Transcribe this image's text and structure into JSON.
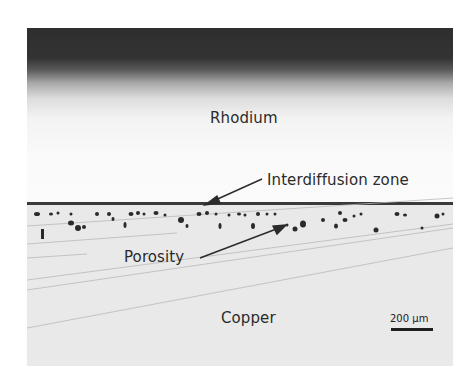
{
  "figure": {
    "type": "optical micrograph cross-section",
    "labels": {
      "top_layer": "Rhodium",
      "interface": "Interdiffusion zone",
      "defects": "Porosity",
      "substrate": "Copper"
    },
    "scale_bar": {
      "label": "200 µm",
      "value": 200,
      "unit": "µm"
    },
    "colors": {
      "rhodium_dark_edge": "#2e2e2e",
      "rhodium_bright": "#fafafa",
      "copper_background": "#e9e9e9",
      "interface_line": "#3a3a3a",
      "pore": "#2a2a2a",
      "label_text": "#2b2b2b"
    }
  }
}
